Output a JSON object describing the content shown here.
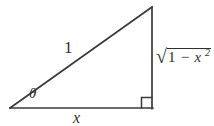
{
  "figure": {
    "type": "right-triangle-trig-diagram",
    "background_color": "#ffffff",
    "stroke_color": "#3a3a3a",
    "text_color": "#2f2f2f",
    "stroke_width": 1.6,
    "geometry": {
      "left_vertex": [
        10,
        108
      ],
      "apex_vertex": [
        152,
        7
      ],
      "right_angle_vertex": [
        152,
        108
      ],
      "right_angle_marker_size": 10
    },
    "labels": {
      "hypotenuse": "1",
      "angle": "θ",
      "base": "x",
      "vertical_radical_sign": "√",
      "vertical_radicand_first": "1",
      "vertical_radicand_operator": "−",
      "vertical_radicand_variable": "x",
      "vertical_radicand_exponent": "2",
      "vertical_full": "√(1 − x²)"
    }
  }
}
